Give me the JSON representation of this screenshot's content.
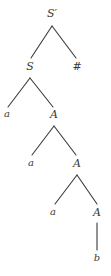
{
  "diagram": {
    "line_color": "#3a3a3a",
    "text_color": "#3a3a3a",
    "background": "#ffffff",
    "nodes": [
      {
        "id": "root",
        "label": "S′",
        "x": 52,
        "y": 13,
        "kind": "nonterminal"
      },
      {
        "id": "s1",
        "label": "S",
        "x": 30,
        "y": 66,
        "kind": "nonterminal"
      },
      {
        "id": "hash",
        "label": "#",
        "x": 77,
        "y": 66,
        "kind": "marker"
      },
      {
        "id": "a1",
        "label": "a",
        "x": 7,
        "y": 114,
        "kind": "terminal"
      },
      {
        "id": "A1",
        "label": "A",
        "x": 54,
        "y": 114,
        "kind": "nonterminal"
      },
      {
        "id": "a2",
        "label": "a",
        "x": 31,
        "y": 163,
        "kind": "terminal"
      },
      {
        "id": "A2",
        "label": "A",
        "x": 77,
        "y": 163,
        "kind": "nonterminal"
      },
      {
        "id": "a3",
        "label": "a",
        "x": 53,
        "y": 212,
        "kind": "terminal"
      },
      {
        "id": "A3",
        "label": "A",
        "x": 97,
        "y": 212,
        "kind": "nonterminal"
      },
      {
        "id": "b1",
        "label": "b",
        "x": 97,
        "y": 258,
        "kind": "terminal"
      }
    ],
    "edges": [
      {
        "from": "root",
        "to": "s1",
        "x1": 52,
        "y1": 26,
        "x2": 31,
        "y2": 58
      },
      {
        "from": "root",
        "to": "hash",
        "x1": 52,
        "y1": 26,
        "x2": 76,
        "y2": 58
      },
      {
        "from": "s1",
        "to": "a1",
        "x1": 30,
        "y1": 78,
        "x2": 8,
        "y2": 107
      },
      {
        "from": "s1",
        "to": "A1",
        "x1": 30,
        "y1": 78,
        "x2": 53,
        "y2": 107
      },
      {
        "from": "A1",
        "to": "a2",
        "x1": 54,
        "y1": 126,
        "x2": 32,
        "y2": 155
      },
      {
        "from": "A1",
        "to": "A2",
        "x1": 54,
        "y1": 126,
        "x2": 76,
        "y2": 155
      },
      {
        "from": "A2",
        "to": "a3",
        "x1": 77,
        "y1": 175,
        "x2": 55,
        "y2": 204
      },
      {
        "from": "A2",
        "to": "A3",
        "x1": 77,
        "y1": 175,
        "x2": 97,
        "y2": 204
      },
      {
        "from": "A3",
        "to": "b1",
        "x1": 97,
        "y1": 223,
        "x2": 97,
        "y2": 250
      }
    ]
  }
}
